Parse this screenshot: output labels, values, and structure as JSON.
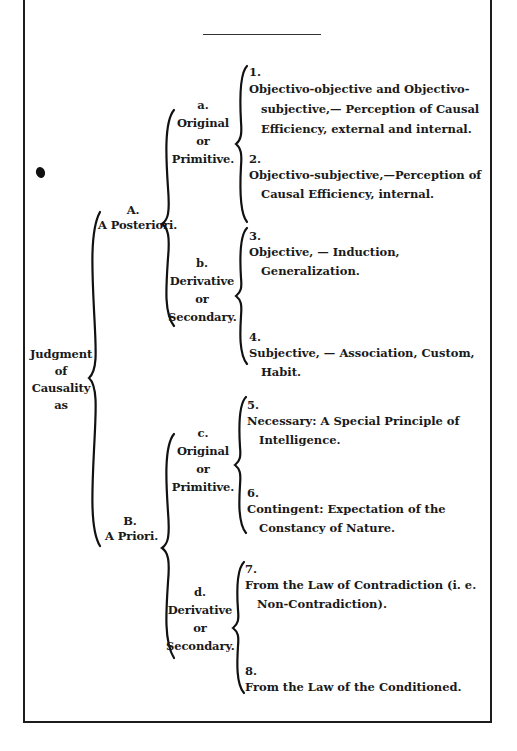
{
  "root": {
    "line1": "Judgment",
    "line2": "of",
    "line3": "Causality",
    "line4": "as"
  },
  "A": {
    "letter": "A.",
    "label": "A Posteriori."
  },
  "B": {
    "letter": "B.",
    "label": "A Priori."
  },
  "a": {
    "letter": "a.",
    "line1": "Original",
    "line2": "or",
    "line3": "Primitive."
  },
  "b": {
    "letter": "b.",
    "line1": "Derivative",
    "line2": "or",
    "line3": "Secondary."
  },
  "c": {
    "letter": "c.",
    "line1": "Original",
    "line2": "or",
    "line3": "Primitive."
  },
  "d": {
    "letter": "d.",
    "line1": "Derivative",
    "line2": "or",
    "line3": "Secondary."
  },
  "items": [
    {
      "num": "1.",
      "text": "Objectivo-objective and Objectivo-subjective,— Perception of Causal Efficiency, external and internal."
    },
    {
      "num": "2.",
      "text": "Objectivo-subjective,—Perception of Causal Efficiency, internal."
    },
    {
      "num": "3.",
      "text": "Objective, — Induction, Generalization."
    },
    {
      "num": "4.",
      "text": "Subjective, — Association, Custom, Habit."
    },
    {
      "num": "5.",
      "text": "Necessary: A Special Principle of Intelligence."
    },
    {
      "num": "6.",
      "text": "Contingent: Expectation of the Constancy of Nature."
    },
    {
      "num": "7.",
      "text": "From the Law of Contradiction (i. e. Non-Contradiction)."
    },
    {
      "num": "8.",
      "text": "From the Law of the Conditioned."
    }
  ]
}
